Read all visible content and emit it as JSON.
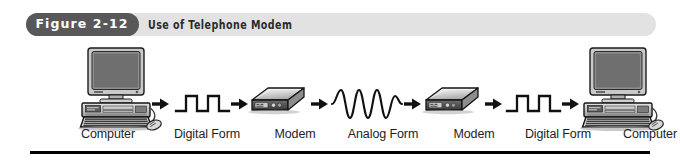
{
  "figure": {
    "badge_label": "Figure 2-12",
    "caption": "Use of Telephone Modem",
    "badge_color": "#58585a",
    "band_color": "#e2e2e2",
    "rule_color": "#000000"
  },
  "diagram": {
    "type": "flow",
    "direction": "left-to-right",
    "nodes": [
      {
        "id": "computer-left",
        "icon": "desktop-computer-icon",
        "label": "Computer",
        "label_x": 58,
        "label_w": 100
      },
      {
        "id": "digital-left",
        "icon": "square-wave-icon",
        "label": "Digital Form",
        "label_x": 152,
        "label_w": 110
      },
      {
        "id": "modem-left",
        "icon": "modem-icon",
        "label": "Modem",
        "label_x": 253,
        "label_w": 84
      },
      {
        "id": "analog",
        "icon": "sine-wave-icon",
        "label": "Analog Form",
        "label_x": 327,
        "label_w": 112
      },
      {
        "id": "modem-right",
        "icon": "modem-icon",
        "label": "Modem",
        "label_x": 432,
        "label_w": 84
      },
      {
        "id": "digital-right",
        "icon": "square-wave-icon",
        "label": "Digital Form",
        "label_x": 503,
        "label_w": 110
      },
      {
        "id": "computer-right",
        "icon": "desktop-computer-icon",
        "label": "Computer",
        "label_x": 600,
        "label_w": 100
      }
    ],
    "arrows": [
      {
        "id": "arrow-1",
        "icon": "arrow-right-icon"
      },
      {
        "id": "arrow-2",
        "icon": "arrow-right-icon"
      },
      {
        "id": "arrow-3",
        "icon": "arrow-right-icon"
      },
      {
        "id": "arrow-4",
        "icon": "arrow-right-icon"
      },
      {
        "id": "arrow-5",
        "icon": "arrow-right-icon"
      },
      {
        "id": "arrow-6",
        "icon": "arrow-right-icon"
      }
    ]
  }
}
